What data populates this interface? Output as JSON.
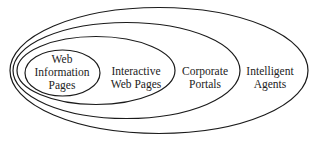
{
  "diagram": {
    "type": "nested-ellipses",
    "stroke_color": "#1a1a1a",
    "background": "#ffffff",
    "levels": [
      {
        "id": "web-information-pages",
        "lines": [
          "Web",
          "Information",
          "Pages"
        ]
      },
      {
        "id": "interactive-web-pages",
        "lines": [
          "Interactive",
          "Web Pages"
        ]
      },
      {
        "id": "corporate-portals",
        "lines": [
          "Corporate",
          "Portals"
        ]
      },
      {
        "id": "intelligent-agents",
        "lines": [
          "Intelligent",
          "Agents"
        ]
      }
    ]
  }
}
